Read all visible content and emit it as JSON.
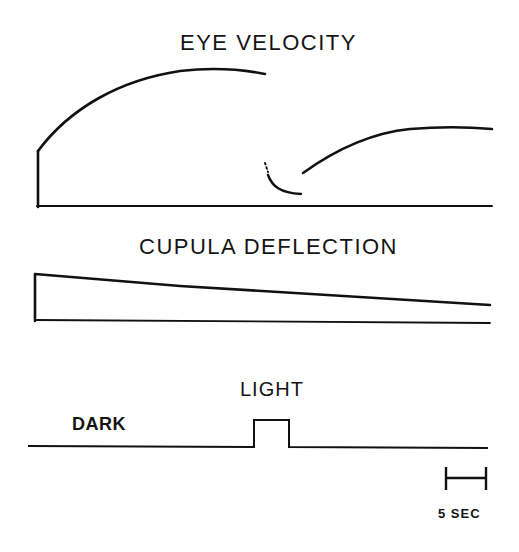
{
  "figure": {
    "panels": [
      {
        "id": "eye-velocity",
        "title": "EYE VELOCITY"
      },
      {
        "id": "cupula-deflection",
        "title": "CUPULA DEFLECTION"
      },
      {
        "id": "light-stimulus",
        "labels": {
          "light": "LIGHT",
          "dark": "DARK"
        }
      }
    ],
    "scale_bar": {
      "label": "5 SEC"
    },
    "colors": {
      "ink": "#111111",
      "background": "#ffffff"
    }
  }
}
